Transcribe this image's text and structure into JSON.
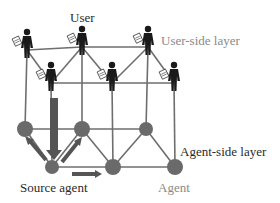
{
  "diagram": {
    "labels": {
      "user": "User",
      "user_layer": "User-side layer",
      "agent_layer": "Agent-side layer",
      "source_agent": "Source agent",
      "agent": "Agent"
    },
    "colors": {
      "line": "#6e6e6e",
      "node": "#6a6a6a",
      "user": "#1a1a1a",
      "arrow": "#4a4a4a"
    },
    "users": [
      {
        "id": "u1",
        "x": 27,
        "y": 40
      },
      {
        "id": "u2",
        "x": 82,
        "y": 37
      },
      {
        "id": "u3",
        "x": 148,
        "y": 37
      },
      {
        "id": "u4",
        "x": 51,
        "y": 73
      },
      {
        "id": "u5",
        "x": 112,
        "y": 73
      },
      {
        "id": "u6",
        "x": 174,
        "y": 73
      }
    ],
    "agents": [
      {
        "id": "a1",
        "x": 25,
        "y": 129,
        "r": 8
      },
      {
        "id": "a2",
        "x": 82,
        "y": 129,
        "r": 8
      },
      {
        "id": "a3",
        "x": 146,
        "y": 129,
        "r": 7
      },
      {
        "id": "a4",
        "x": 52,
        "y": 167,
        "r": 7
      },
      {
        "id": "a5",
        "x": 113,
        "y": 167,
        "r": 8
      },
      {
        "id": "a6",
        "x": 175,
        "y": 167,
        "r": 8
      }
    ],
    "user_edges": [
      [
        "u1",
        "u2"
      ],
      [
        "u2",
        "u3"
      ],
      [
        "u1",
        "u4"
      ],
      [
        "u2",
        "u4"
      ],
      [
        "u2",
        "u5"
      ],
      [
        "u3",
        "u5"
      ],
      [
        "u3",
        "u6"
      ],
      [
        "u4",
        "u5"
      ],
      [
        "u5",
        "u6"
      ]
    ],
    "agent_edges": [
      [
        "a1",
        "a2"
      ],
      [
        "a2",
        "a3"
      ],
      [
        "a1",
        "a4"
      ],
      [
        "a2",
        "a4"
      ],
      [
        "a2",
        "a5"
      ],
      [
        "a3",
        "a5"
      ],
      [
        "a3",
        "a6"
      ],
      [
        "a4",
        "a5"
      ],
      [
        "a5",
        "a6"
      ]
    ],
    "cross_edges": [
      [
        "u1",
        "a1"
      ],
      [
        "u2",
        "a2"
      ],
      [
        "u3",
        "a3"
      ],
      [
        "u4",
        "a4"
      ],
      [
        "u5",
        "a5"
      ],
      [
        "u6",
        "a6"
      ]
    ]
  }
}
